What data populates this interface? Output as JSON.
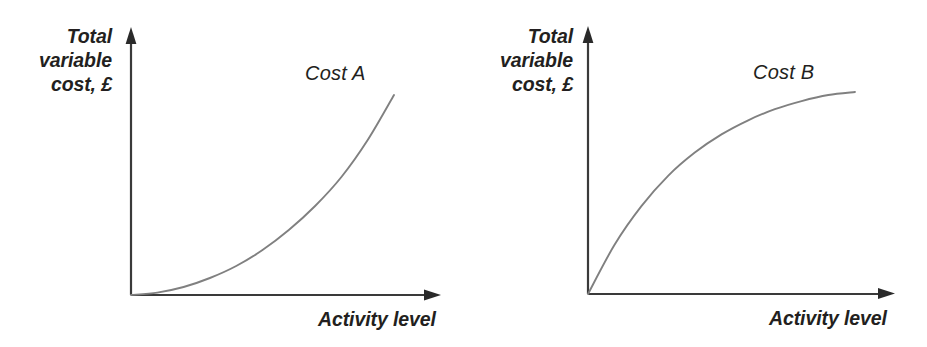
{
  "figure": {
    "background_color": "#ffffff",
    "axis_color": "#3a3a3a",
    "curve_color": "#808080",
    "text_color": "#231f20",
    "width": 927,
    "height": 347
  },
  "panels": [
    {
      "id": "cost-a",
      "series_label": "Cost A",
      "ylabel": "Total variable cost, £",
      "ylabel_lines": [
        "Total",
        "variable",
        "cost, £"
      ],
      "xlabel": "Activity level"
    },
    {
      "id": "cost-b",
      "series_label": "Cost B",
      "ylabel": "Total variable cost, £",
      "ylabel_lines": [
        "Total",
        "variable",
        "cost, £"
      ],
      "xlabel": "Activity level"
    }
  ],
  "chart_data": [
    {
      "type": "line",
      "title": "Cost A",
      "xlabel": "Activity level",
      "ylabel": "Total variable cost, £",
      "grid": false,
      "legend": "none",
      "annotations": [
        "Cost A"
      ],
      "axis_ticks": {
        "x": [],
        "y": []
      },
      "xlim": [
        0,
        1
      ],
      "ylim": [
        0,
        1
      ],
      "shape": "convex-increasing",
      "description": "Total variable cost rises at an increasing rate as activity level rises (economies reversed / progressive variable cost).",
      "x": [
        0,
        0.1,
        0.2,
        0.3,
        0.4,
        0.5,
        0.6,
        0.7,
        0.8,
        0.9,
        1.0
      ],
      "y": [
        0,
        0.012,
        0.04,
        0.085,
        0.145,
        0.225,
        0.325,
        0.445,
        0.59,
        0.775,
        1.0
      ]
    },
    {
      "type": "line",
      "title": "Cost B",
      "xlabel": "Activity level",
      "ylabel": "Total variable cost, £",
      "grid": false,
      "legend": "none",
      "annotations": [
        "Cost B"
      ],
      "axis_ticks": {
        "x": [],
        "y": []
      },
      "xlim": [
        0,
        1
      ],
      "ylim": [
        0,
        1
      ],
      "shape": "concave-increasing",
      "description": "Total variable cost rises at a decreasing rate as activity level rises (bulk discount / regressive variable cost).",
      "x": [
        0,
        0.1,
        0.2,
        0.3,
        0.4,
        0.5,
        0.6,
        0.7,
        0.8,
        0.9,
        1.0
      ],
      "y": [
        0,
        0.245,
        0.435,
        0.585,
        0.7,
        0.79,
        0.86,
        0.915,
        0.955,
        0.985,
        1.0
      ]
    }
  ]
}
